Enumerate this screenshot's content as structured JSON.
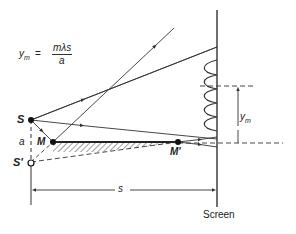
{
  "figure": {
    "type": "Lloyd's mirror interference diagram",
    "formula": {
      "lhs": "y",
      "lhs_sub": "m",
      "equals": "=",
      "numerator": "mλs",
      "denominator": "a"
    },
    "labels": {
      "source": "S",
      "virtual_source": "S'",
      "mirror_start": "M",
      "mirror_end": "M'",
      "separation": "a",
      "distance": "s",
      "fringe_offset": "y",
      "fringe_offset_sub": "m",
      "screen": "Screen"
    },
    "colors": {
      "line": "#333333",
      "background": "#ffffff"
    }
  }
}
